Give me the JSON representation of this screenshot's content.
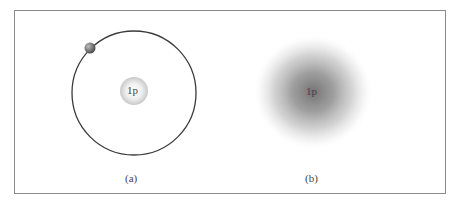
{
  "figure": {
    "panel_a": {
      "caption": "(a)",
      "nucleus_label": "1p",
      "description": "Bohr model: proton nucleus with electron on circular orbit"
    },
    "panel_b": {
      "caption": "(b)",
      "nucleus_label": "1p",
      "description": "Electron cloud model: probability density around proton"
    }
  }
}
